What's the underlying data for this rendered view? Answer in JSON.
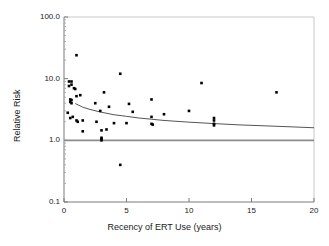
{
  "chart_data": {
    "type": "scatter",
    "title": "",
    "xlabel": "Recency of ERT Use (years)",
    "ylabel": "Relative Risk",
    "xlim": [
      0,
      20
    ],
    "ylim": [
      0.1,
      100.0
    ],
    "yscale": "log",
    "xscale": "linear",
    "grid": false,
    "legend": null,
    "xticks": [
      0,
      5,
      10,
      15,
      20
    ],
    "xtick_labels": [
      "0",
      "5",
      "10",
      "15",
      "20"
    ],
    "yticks": [
      0.1,
      1.0,
      10.0,
      100.0
    ],
    "ytick_labels": [
      "0.1",
      "1.0",
      "10.0",
      "100.0"
    ],
    "series": [
      {
        "name": "studies",
        "type": "scatter",
        "marker": "filled-square",
        "color": "#000000",
        "points": [
          [
            0.3,
            2.8
          ],
          [
            0.4,
            9.0
          ],
          [
            0.4,
            7.6
          ],
          [
            0.5,
            4.6
          ],
          [
            0.5,
            4.2
          ],
          [
            0.5,
            2.3
          ],
          [
            0.6,
            9.0
          ],
          [
            0.6,
            8.0
          ],
          [
            0.6,
            4.5
          ],
          [
            0.6,
            4.0
          ],
          [
            0.7,
            2.4
          ],
          [
            0.8,
            7.0
          ],
          [
            0.9,
            6.8
          ],
          [
            1.0,
            24.0
          ],
          [
            1.0,
            5.2
          ],
          [
            1.0,
            2.1
          ],
          [
            1.1,
            2.0
          ],
          [
            1.3,
            5.4
          ],
          [
            1.5,
            2.1
          ],
          [
            1.5,
            1.4
          ],
          [
            2.5,
            4.0
          ],
          [
            2.6,
            2.0
          ],
          [
            2.9,
            3.0
          ],
          [
            3.0,
            1.45
          ],
          [
            3.0,
            1.1
          ],
          [
            3.0,
            1.05
          ],
          [
            3.0,
            1.0
          ],
          [
            3.2,
            6.0
          ],
          [
            3.4,
            1.5
          ],
          [
            3.6,
            3.5
          ],
          [
            4.0,
            1.9
          ],
          [
            4.5,
            12.0
          ],
          [
            4.5,
            0.4
          ],
          [
            5.0,
            1.9
          ],
          [
            5.2,
            3.9
          ],
          [
            5.5,
            2.9
          ],
          [
            7.0,
            4.6
          ],
          [
            7.0,
            2.4
          ],
          [
            7.0,
            1.85
          ],
          [
            7.1,
            1.8
          ],
          [
            8.0,
            2.65
          ],
          [
            10.0,
            3.0
          ],
          [
            11.0,
            8.5
          ],
          [
            12.0,
            2.3
          ],
          [
            12.0,
            2.1
          ],
          [
            12.0,
            1.85
          ],
          [
            12.0,
            1.75
          ],
          [
            17.0,
            6.0
          ]
        ]
      },
      {
        "name": "fitted-trend",
        "type": "line",
        "color": "#555555",
        "points": [
          [
            0.9,
            3.95
          ],
          [
            1.5,
            3.45
          ],
          [
            2.0,
            3.2
          ],
          [
            3.0,
            2.85
          ],
          [
            4.0,
            2.6
          ],
          [
            5.0,
            2.45
          ],
          [
            6.0,
            2.3
          ],
          [
            7.0,
            2.2
          ],
          [
            8.0,
            2.1
          ],
          [
            10.0,
            1.97
          ],
          [
            12.0,
            1.87
          ],
          [
            14.0,
            1.78
          ],
          [
            16.0,
            1.72
          ],
          [
            18.0,
            1.66
          ],
          [
            20.0,
            1.6
          ]
        ]
      },
      {
        "name": "null-reference-line",
        "type": "hline",
        "color": "#8c8c8c",
        "value": 1.0
      }
    ]
  },
  "axes": {
    "y_title": "Relative Risk",
    "x_title": "Recency of ERT Use (years)"
  }
}
